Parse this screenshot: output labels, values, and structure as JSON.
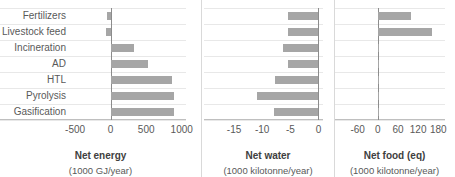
{
  "chart_data": [
    {
      "type": "bar",
      "orientation": "horizontal",
      "title": "Net energy",
      "subtitle": "(1000 GJ/year)",
      "xlabel": "Net energy",
      "ylabel": "",
      "categories": [
        "Fertilizers",
        "Livestock feed",
        "Incineration",
        "AD",
        "HTL",
        "Pyrolysis",
        "Gasification"
      ],
      "values": [
        -50,
        -62,
        330,
        520,
        858,
        885,
        895
      ],
      "xlim": [
        -600,
        1060
      ],
      "xticks": [
        -500,
        0,
        500,
        1000
      ],
      "xticklabels": [
        "-500",
        "0",
        "500",
        "1000"
      ],
      "grid": true,
      "legend": "none",
      "bar_color": "#a6a6a6"
    },
    {
      "type": "bar",
      "orientation": "horizontal",
      "title": "Net water",
      "subtitle": "(1000 kilotonne/year)",
      "xlabel": "Net water",
      "ylabel": "",
      "categories": [
        "Fertilizers",
        "Livestock feed",
        "Incineration",
        "AD",
        "HTL",
        "Pyrolysis",
        "Gasification"
      ],
      "values": [
        -5.4,
        -5.4,
        -6.3,
        -5.4,
        -7.7,
        -10.9,
        -7.9
      ],
      "xlim": [
        -17.5,
        0.8
      ],
      "xticks": [
        -15,
        -10,
        -5,
        0
      ],
      "xticklabels": [
        "-15",
        "-10",
        "-5",
        "0"
      ],
      "grid": true,
      "legend": "none",
      "bar_color": "#a6a6a6"
    },
    {
      "type": "bar",
      "orientation": "horizontal",
      "title": "Net food (eq)",
      "subtitle": "(1000 kilotonne/year)",
      "xlabel": "Net food (eq)",
      "ylabel": "",
      "categories": [
        "Fertilizers",
        "Livestock feed",
        "Incineration",
        "AD",
        "HTL",
        "Pyrolysis",
        "Gasification"
      ],
      "values": [
        100,
        160,
        2,
        2,
        2,
        2,
        2
      ],
      "xlim": [
        -80,
        200
      ],
      "xticks": [
        -60,
        0,
        60,
        120,
        180
      ],
      "xticklabels": [
        "-60",
        "0",
        "60",
        "120",
        "180"
      ],
      "grid": true,
      "legend": "none",
      "bar_color": "#a6a6a6"
    }
  ],
  "panels": {
    "p1": {
      "title": "Net energy",
      "subtitle": "(1000 GJ/year)",
      "cats": [
        "Fertilizers",
        "Livestock feed",
        "Incineration",
        "AD",
        "HTL",
        "Pyrolysis",
        "Gasification"
      ],
      "ticks": [
        "-500",
        "0",
        "500",
        "1000"
      ]
    },
    "p2": {
      "title": "Net water",
      "subtitle": "(1000 kilotonne/year)",
      "ticks": [
        "-15",
        "-10",
        "-5",
        "0"
      ]
    },
    "p3": {
      "title": "Net food (eq)",
      "subtitle": "(1000 kilotonne/year)",
      "ticks": [
        "-60",
        "0",
        "60",
        "120",
        "180"
      ]
    }
  }
}
